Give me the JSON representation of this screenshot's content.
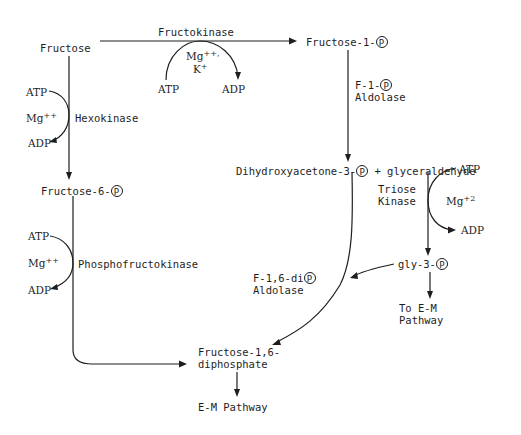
{
  "compounds": {
    "fructose": "Fructose",
    "fructose_1p": "Fructose-1-",
    "fructose_6p": "Fructose-6-",
    "dhap": "Dihydroxyacetone-3-",
    "plus_glyceraldehyde": "+ glyceraldehyde",
    "gly_3p": "gly-3-",
    "f16dp_line1": "Fructose-1,6-",
    "f16dp_line2": "diphosphate",
    "em_pathway": "E-M Pathway",
    "to_em_line1": "To E-M",
    "to_em_line2": "Pathway"
  },
  "phosphate_symbol": "P",
  "enzymes": {
    "fructokinase": "Fructokinase",
    "hexokinase": "Hexokinase",
    "phosphofructokinase": "Phosphofructokinase",
    "f1p_aldolase_line1": "F-1-",
    "f1p_aldolase_line2": "Aldolase",
    "triose_kinase_line1": "Triose",
    "triose_kinase_line2": "Kinase",
    "f16dp_aldolase_line1": "F-1,6-di",
    "f16dp_aldolase_line2": "Aldolase"
  },
  "cofactors": {
    "fructokinase": {
      "atp": "ATP",
      "adp": "ADP",
      "mg": "Mg",
      "mg_sup": "++,",
      "k": "K",
      "k_sup": "+"
    },
    "hexokinase": {
      "atp": "ATP",
      "adp": "ADP",
      "mg": "Mg",
      "mg_sup": "++"
    },
    "phosphofructokinase": {
      "atp": "ATP",
      "adp": "ADP",
      "mg": "Mg",
      "mg_sup": "++"
    },
    "triose_kinase": {
      "atp": "ATP",
      "adp": "ADP",
      "mg": "Mg",
      "mg_sup": "+2"
    }
  }
}
